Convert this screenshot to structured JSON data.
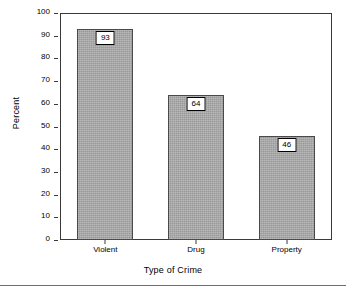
{
  "chart_data": {
    "type": "bar",
    "title": "",
    "categories": [
      "Violent",
      "Drug",
      "Property"
    ],
    "values": [
      93,
      64,
      46
    ],
    "xlabel": "Type of Crime",
    "ylabel": "Percent",
    "ylim": [
      0,
      100
    ],
    "ytick_labels": [
      "0",
      "10",
      "20",
      "30",
      "40",
      "50",
      "60",
      "70",
      "80",
      "90",
      "100"
    ],
    "ytick_values": [
      0,
      10,
      20,
      30,
      40,
      50,
      60,
      70,
      80,
      90,
      100
    ],
    "grid": false,
    "legend": "none",
    "data_labels": [
      "93",
      "64",
      "46"
    ],
    "colors": {
      "bar_fill": "#a9a9a9",
      "bar_edge": "#4a4a4a",
      "axis": "#3a3a3a",
      "text": "#000000",
      "background": "#ffffff",
      "label_box_fill": "#ffffff",
      "label_box_edge": "#000000"
    }
  }
}
